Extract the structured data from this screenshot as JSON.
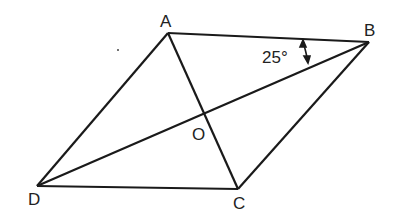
{
  "diagram": {
    "vertices": {
      "A": {
        "label": "A",
        "x": 168,
        "y": 33
      },
      "B": {
        "label": "B",
        "x": 369,
        "y": 42
      },
      "C": {
        "label": "C",
        "x": 238,
        "y": 189
      },
      "D": {
        "label": "D",
        "x": 37,
        "y": 186
      }
    },
    "center": {
      "label": "O"
    },
    "angle_annotation": {
      "label": "25°",
      "at": "B",
      "between": [
        "BA",
        "BD"
      ]
    }
  }
}
